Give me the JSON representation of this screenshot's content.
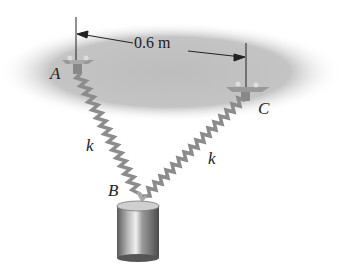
{
  "diagram": {
    "dimension": {
      "label": "0.6 m"
    },
    "points": {
      "A": "A",
      "B": "B",
      "C": "C"
    },
    "springs": {
      "left_label": "k",
      "right_label": "k"
    },
    "colors": {
      "ceiling": "#b8b8b8",
      "spring": "#9a9a9a",
      "weight": "#8a8a8a",
      "text": "#222222"
    }
  }
}
